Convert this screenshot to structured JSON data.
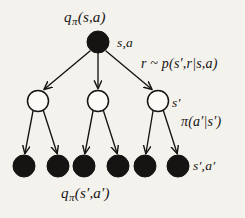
{
  "figure": {
    "background_color": "#f4f2ed",
    "ink_color": "#161412",
    "node_fill_open": "#ffffff",
    "node_fill_closed": "#161412"
  },
  "labels": {
    "root_value": {
      "symbol": "q",
      "subscript": "π",
      "args": "(s,a)"
    },
    "root_node": "s,a",
    "transition": "r ~ p(s′,r|s,a)",
    "mid_node": "s′",
    "policy": "π(a′|s′)",
    "leaf_node": "s′,a′",
    "leaf_value": {
      "symbol": "q",
      "subscript": "π",
      "args": "(s′,a′)"
    }
  },
  "graph": {
    "root": {
      "id": "root",
      "cx": 98,
      "cy": 42,
      "r": 11,
      "filled": true
    },
    "mid_nodes": [
      {
        "id": "mid-1",
        "cx": 38,
        "cy": 101,
        "r": 10.5,
        "filled": false
      },
      {
        "id": "mid-2",
        "cx": 98,
        "cy": 101,
        "r": 10.5,
        "filled": false
      },
      {
        "id": "mid-3",
        "cx": 158,
        "cy": 101,
        "r": 10.5,
        "filled": false
      }
    ],
    "leaf_nodes": [
      {
        "id": "leaf-1",
        "cx": 24,
        "cy": 166,
        "r": 11,
        "filled": true
      },
      {
        "id": "leaf-2",
        "cx": 58,
        "cy": 166,
        "r": 11,
        "filled": true
      },
      {
        "id": "leaf-3",
        "cx": 84,
        "cy": 166,
        "r": 11,
        "filled": true
      },
      {
        "id": "leaf-4",
        "cx": 118,
        "cy": 166,
        "r": 11,
        "filled": true
      },
      {
        "id": "leaf-5",
        "cx": 145,
        "cy": 166,
        "r": 11,
        "filled": true
      },
      {
        "id": "leaf-6",
        "cx": 178,
        "cy": 166,
        "r": 11,
        "filled": true
      }
    ],
    "edges_level1": [
      {
        "id": "edge-root-mid-1",
        "x1": 90,
        "y1": 51,
        "x2": 44,
        "y2": 89
      },
      {
        "id": "edge-root-mid-2",
        "x1": 98,
        "y1": 53,
        "x2": 98,
        "y2": 88
      },
      {
        "id": "edge-root-mid-3",
        "x1": 106,
        "y1": 51,
        "x2": 152,
        "y2": 89
      }
    ],
    "edges_level2": [
      {
        "id": "edge-mid1-leaf1",
        "x1": 33,
        "y1": 111,
        "x2": 25,
        "y2": 153
      },
      {
        "id": "edge-mid1-leaf2",
        "x1": 43,
        "y1": 111,
        "x2": 57,
        "y2": 153
      },
      {
        "id": "edge-mid2-leaf3",
        "x1": 93,
        "y1": 111,
        "x2": 85,
        "y2": 153
      },
      {
        "id": "edge-mid2-leaf4",
        "x1": 103,
        "y1": 111,
        "x2": 117,
        "y2": 153
      },
      {
        "id": "edge-mid3-leaf5",
        "x1": 153,
        "y1": 111,
        "x2": 146,
        "y2": 153
      },
      {
        "id": "edge-mid3-leaf6",
        "x1": 163,
        "y1": 111,
        "x2": 177,
        "y2": 153
      }
    ]
  }
}
